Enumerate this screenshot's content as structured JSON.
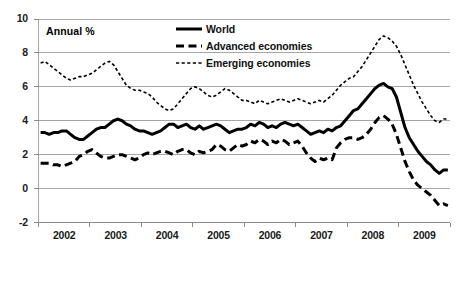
{
  "chart_data": {
    "type": "line",
    "title": "",
    "subtitle": "",
    "annotation": "Annual %",
    "xlabel": "",
    "ylabel": "",
    "ylim": [
      -2,
      10
    ],
    "yticks": [
      10,
      8,
      6,
      4,
      2,
      0,
      -2
    ],
    "ytick_labels": [
      "10",
      "8",
      "6",
      "4",
      "2",
      "0",
      "-2"
    ],
    "xlim": [
      2002.0,
      2010.0
    ],
    "xticks": [
      2002,
      2003,
      2004,
      2005,
      2006,
      2007,
      2008,
      2009
    ],
    "xtick_labels": [
      "2002",
      "2003",
      "2004",
      "2005",
      "2006",
      "2007",
      "2008",
      "2009"
    ],
    "grid": "horizontal",
    "legend_position": "top-right",
    "x_frequency": "monthly",
    "series": [
      {
        "name": "World",
        "style": "solid",
        "color": "#000000",
        "values": [
          3.3,
          3.3,
          3.2,
          3.3,
          3.3,
          3.4,
          3.4,
          3.2,
          3.0,
          2.9,
          2.9,
          3.1,
          3.3,
          3.5,
          3.6,
          3.6,
          3.8,
          4.0,
          4.1,
          4.0,
          3.8,
          3.7,
          3.5,
          3.4,
          3.4,
          3.3,
          3.2,
          3.3,
          3.4,
          3.6,
          3.8,
          3.8,
          3.6,
          3.7,
          3.8,
          3.6,
          3.5,
          3.7,
          3.5,
          3.6,
          3.7,
          3.8,
          3.7,
          3.5,
          3.3,
          3.4,
          3.5,
          3.5,
          3.6,
          3.8,
          3.7,
          3.9,
          3.8,
          3.6,
          3.7,
          3.6,
          3.8,
          3.9,
          3.8,
          3.7,
          3.8,
          3.6,
          3.4,
          3.2,
          3.3,
          3.4,
          3.3,
          3.5,
          3.4,
          3.6,
          3.7,
          4.0,
          4.3,
          4.6,
          4.7,
          5.0,
          5.3,
          5.6,
          5.9,
          6.1,
          6.2,
          6.0,
          5.9,
          5.4,
          4.5,
          3.6,
          3.0,
          2.6,
          2.2,
          1.9,
          1.6,
          1.4,
          1.1,
          0.9,
          1.1,
          1.1
        ]
      },
      {
        "name": "Advanced economies",
        "style": "dashed",
        "color": "#000000",
        "values": [
          1.5,
          1.5,
          1.5,
          1.4,
          1.4,
          1.3,
          1.4,
          1.5,
          1.6,
          1.9,
          2.0,
          2.2,
          2.3,
          2.1,
          1.9,
          1.8,
          1.8,
          1.9,
          2.0,
          2.0,
          1.9,
          1.8,
          1.7,
          1.8,
          2.0,
          2.1,
          2.0,
          2.1,
          2.2,
          2.2,
          2.1,
          2.0,
          2.2,
          2.3,
          2.3,
          2.1,
          2.0,
          2.2,
          2.1,
          2.2,
          2.3,
          2.6,
          2.5,
          2.3,
          2.2,
          2.4,
          2.6,
          2.5,
          2.6,
          2.8,
          2.7,
          2.9,
          2.8,
          2.6,
          2.8,
          2.7,
          2.9,
          2.8,
          2.6,
          2.7,
          2.8,
          2.5,
          2.1,
          1.8,
          1.6,
          1.8,
          1.7,
          1.8,
          1.7,
          2.4,
          2.7,
          2.9,
          3.0,
          3.0,
          2.9,
          3.0,
          3.2,
          3.5,
          3.9,
          4.2,
          4.3,
          4.1,
          3.8,
          3.2,
          2.4,
          1.6,
          1.0,
          0.5,
          0.2,
          0.0,
          -0.2,
          -0.4,
          -0.7,
          -1.0,
          -0.9,
          -1.0
        ]
      },
      {
        "name": "Emerging economies",
        "style": "dotted",
        "color": "#000000",
        "values": [
          7.4,
          7.5,
          7.3,
          7.1,
          6.9,
          6.7,
          6.5,
          6.4,
          6.5,
          6.6,
          6.6,
          6.7,
          6.8,
          7.0,
          7.2,
          7.4,
          7.5,
          7.3,
          6.9,
          6.5,
          6.1,
          5.9,
          5.8,
          5.8,
          5.7,
          5.6,
          5.4,
          5.1,
          4.9,
          4.7,
          4.6,
          4.7,
          5.0,
          5.3,
          5.6,
          5.9,
          6.0,
          5.9,
          5.7,
          5.5,
          5.4,
          5.5,
          5.7,
          5.9,
          5.8,
          5.6,
          5.4,
          5.2,
          5.2,
          5.1,
          5.0,
          5.2,
          5.1,
          5.0,
          5.1,
          5.2,
          5.3,
          5.2,
          5.1,
          5.2,
          5.3,
          5.2,
          5.1,
          5.0,
          5.1,
          5.2,
          5.1,
          5.3,
          5.5,
          5.8,
          6.1,
          6.3,
          6.5,
          6.6,
          6.9,
          7.2,
          7.6,
          8.0,
          8.4,
          8.8,
          9.0,
          8.9,
          8.7,
          8.4,
          7.9,
          7.3,
          6.7,
          6.1,
          5.6,
          5.1,
          4.7,
          4.3,
          4.0,
          3.9,
          4.1,
          4.1
        ]
      }
    ]
  },
  "legend": {
    "items": [
      {
        "label": "World",
        "style": "solid"
      },
      {
        "label": "Advanced economies",
        "style": "dashed"
      },
      {
        "label": "Emerging economies",
        "style": "dotted"
      }
    ]
  }
}
